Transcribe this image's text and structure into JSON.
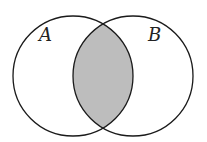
{
  "diagram": {
    "type": "venn",
    "sets": [
      {
        "label": "A",
        "cx": 73,
        "cy": 76,
        "r": 60
      },
      {
        "label": "B",
        "cx": 133,
        "cy": 76,
        "r": 60
      }
    ],
    "shaded_region": "A ∩ B",
    "colors": {
      "stroke": "#1a1a1a",
      "shade": "#bdbdbd",
      "background": "#ffffff"
    }
  }
}
